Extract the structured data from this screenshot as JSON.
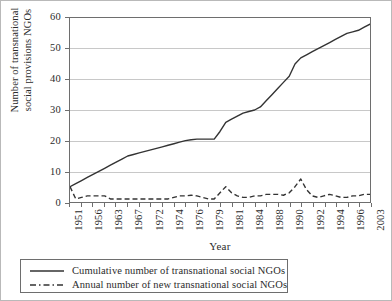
{
  "chart_data": {
    "type": "line",
    "title": "",
    "xlabel": "Year",
    "ylabel": "Number of transnational social provisions NGOs",
    "ylabel_line1": "Number of transnational",
    "ylabel_line2": "social provisions NGOs",
    "ylim": [
      0,
      60
    ],
    "yticks": [
      0,
      10,
      20,
      30,
      40,
      50,
      60
    ],
    "grid": true,
    "legend_position": "below-axes",
    "xlim": [
      1951,
      2003
    ],
    "tick_labels": [
      "1951",
      "1956",
      "1963",
      "1967",
      "1972",
      "1974",
      "1976",
      "1979",
      "1981",
      "1984",
      "1988",
      "1990",
      "1992",
      "1994",
      "1996",
      "2003"
    ],
    "x": [
      1951,
      1952,
      1953,
      1954,
      1955,
      1956,
      1957,
      1958,
      1959,
      1960,
      1961,
      1962,
      1963,
      1964,
      1965,
      1966,
      1967,
      1968,
      1969,
      1970,
      1971,
      1972,
      1973,
      1974,
      1975,
      1976,
      1977,
      1978,
      1979,
      1980,
      1981,
      1982,
      1983,
      1984,
      1985,
      1986,
      1987,
      1988,
      1989,
      1990,
      1991,
      1992,
      1993,
      1994,
      1995,
      1996,
      1997,
      1998,
      1999,
      2000,
      2001,
      2002,
      2003
    ],
    "series": [
      {
        "name": "Cumulative number of transnational social NGOs",
        "style": "solid",
        "color": "#333333",
        "values": [
          5,
          6,
          7,
          8,
          9,
          10,
          11,
          12,
          13,
          14,
          15,
          15.5,
          16,
          16.5,
          17,
          17.5,
          18,
          18.5,
          19,
          19.5,
          20,
          20.3,
          20.5,
          20.5,
          20.5,
          20.5,
          23,
          26,
          27,
          28,
          29,
          29.5,
          30,
          31,
          33,
          35,
          37,
          39,
          41,
          45,
          47,
          48,
          49,
          50,
          51,
          52,
          53,
          54,
          55,
          55.5,
          56,
          57,
          58
        ]
      },
      {
        "name": "Annual number of new transnational social NGOs",
        "style": "dashed",
        "color": "#333333",
        "values": [
          5,
          1,
          1.5,
          2,
          2,
          2,
          2,
          1,
          1,
          1,
          1,
          1,
          1,
          1,
          1,
          1,
          1,
          1,
          1.5,
          2,
          2,
          2.2,
          2,
          1.5,
          1,
          1,
          3,
          5,
          3,
          2,
          1.5,
          1.5,
          2,
          2,
          2.5,
          2.5,
          2.5,
          2.2,
          3,
          5,
          7.5,
          4,
          2,
          1.5,
          2,
          2.5,
          2,
          1.5,
          1.5,
          2,
          2,
          2.5,
          2.5
        ]
      }
    ]
  },
  "axes": {
    "y_tick_labels": [
      "60",
      "50",
      "40",
      "30",
      "20",
      "10",
      "0"
    ],
    "x_tick_labels": [
      "1951",
      "1956",
      "1963",
      "1967",
      "1972",
      "1974",
      "1976",
      "1979",
      "1981",
      "1984",
      "1988",
      "1990",
      "1992",
      "1994",
      "1996",
      "2003"
    ],
    "x_title": "Year",
    "y_title_line1": "Number of transnational",
    "y_title_line2": "social provisions NGOs"
  },
  "legend": {
    "items": [
      {
        "label": "Cumulative number of transnational social NGOs",
        "style": "solid"
      },
      {
        "label": "Annual number of new transnational social NGOs",
        "style": "dashed"
      }
    ]
  },
  "colors": {
    "line": "#333333",
    "grid": "#c8c8c8",
    "axis": "#6e6e6e",
    "frame": "#b9b9b9",
    "text": "#2b2b2b"
  }
}
